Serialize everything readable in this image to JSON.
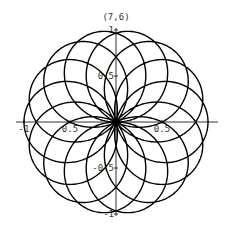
{
  "chart_data": {
    "type": "line",
    "title": "(7,6)",
    "n": 7,
    "d": 6,
    "equation": "r = cos(7θ/6)",
    "xlim": [
      -1,
      1
    ],
    "ylim": [
      -1,
      1
    ],
    "x_ticks": [
      {
        "value": -1,
        "label": "-1"
      },
      {
        "value": -0.5,
        "label": "0.5"
      },
      {
        "value": 0.5,
        "label": "0.5"
      }
    ],
    "y_ticks": [
      {
        "value": 1,
        "label": "1"
      },
      {
        "value": 0.5,
        "label": "0.5"
      },
      {
        "value": -0.5,
        "label": "-0.5"
      },
      {
        "value": -1,
        "label": "-1"
      }
    ],
    "grid": false,
    "line_color": "#000000",
    "axis_color": "#333333"
  }
}
